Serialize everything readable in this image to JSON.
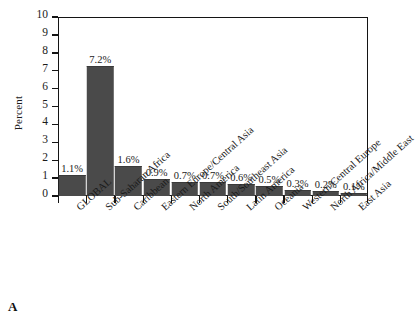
{
  "panel": {
    "letter": "A"
  },
  "chart_data": {
    "type": "bar",
    "title": "",
    "xlabel": "",
    "ylabel": "Percent",
    "ylim": [
      0,
      10
    ],
    "yticks": [
      0,
      1,
      2,
      3,
      4,
      5,
      6,
      7,
      8,
      9,
      10
    ],
    "ytick_labels": [
      "0",
      "1",
      "2",
      "3",
      "4",
      "5",
      "6",
      "7",
      "8",
      "9",
      "10"
    ],
    "grid": false,
    "legend": null,
    "bar_color": "#4a4a4a",
    "categories": [
      "GLOBAL",
      "Sub-Saharan Africa",
      "Caribbean",
      "Eastern Europe/Central Asia",
      "North America",
      "South/Southeast Asia",
      "Latin America",
      "Oceania",
      "Western/Central Europe",
      "North Africa/Middle East",
      "East Asia"
    ],
    "values": [
      1.1,
      7.2,
      1.6,
      0.9,
      0.7,
      0.7,
      0.6,
      0.5,
      0.3,
      0.2,
      0.1
    ],
    "data_labels": [
      "1.1%",
      "7.2%",
      "1.6%",
      "0.9%",
      "0.7%",
      "0.7%",
      "0.6%",
      "0.5%",
      "0.3%",
      "0.2%",
      "0.1%"
    ]
  }
}
